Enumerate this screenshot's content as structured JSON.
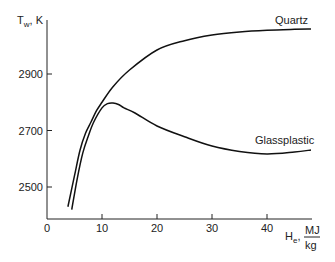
{
  "chart_data": {
    "type": "line",
    "title": "",
    "xlabel": "H_e, MJ/kg",
    "xlabel_parts": {
      "symbol": "H",
      "sub": "e",
      "sep": ",",
      "unit_num": "MJ",
      "unit_den": "kg"
    },
    "ylabel": "T_w, K",
    "ylabel_parts": {
      "symbol": "T",
      "sub": "w",
      "unit": ", K"
    },
    "xlim": [
      0,
      50
    ],
    "ylim": [
      2385,
      3090
    ],
    "xticks": [
      0,
      10,
      20,
      30,
      40
    ],
    "yticks": [
      2500,
      2700,
      2900
    ],
    "grid": false,
    "series": [
      {
        "name": "Quartz",
        "x": [
          3.8,
          5,
          6,
          7,
          8,
          9,
          10,
          12,
          15,
          20,
          25,
          30,
          35,
          40,
          45,
          48
        ],
        "y": [
          2430,
          2540,
          2630,
          2690,
          2730,
          2770,
          2800,
          2855,
          2914,
          2985,
          3018,
          3038,
          3049,
          3055,
          3058,
          3059
        ]
      },
      {
        "name": "Glassplastic",
        "x": [
          4.5,
          5.5,
          6.5,
          7.5,
          8.5,
          10,
          11,
          12,
          13,
          14,
          16,
          20,
          25,
          30,
          35,
          40,
          45,
          48
        ],
        "y": [
          2420,
          2530,
          2620,
          2680,
          2730,
          2780,
          2795,
          2797,
          2792,
          2780,
          2762,
          2716,
          2678,
          2645,
          2626,
          2617,
          2624,
          2631
        ]
      }
    ],
    "annotations": [
      {
        "text": "Quartz",
        "series": "Quartz",
        "position": "above line end"
      },
      {
        "text": "Glassplastic",
        "series": "Glassplastic",
        "position": "above line end"
      }
    ]
  }
}
